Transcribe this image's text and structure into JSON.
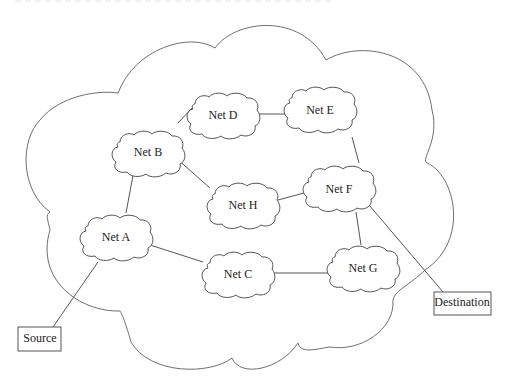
{
  "diagram": {
    "type": "network-topology",
    "internet_cloud_label": "",
    "nodes": [
      {
        "id": "A",
        "label": "Net A",
        "cx": 115,
        "cy": 238
      },
      {
        "id": "B",
        "label": "Net B",
        "cx": 145,
        "cy": 128
      },
      {
        "id": "C",
        "label": "Net C",
        "cx": 237,
        "cy": 275
      },
      {
        "id": "D",
        "label": "Net D",
        "cx": 222,
        "cy": 90
      },
      {
        "id": "E",
        "label": "Net E",
        "cx": 320,
        "cy": 83
      },
      {
        "id": "F",
        "label": "Net F",
        "cx": 340,
        "cy": 190
      },
      {
        "id": "G",
        "label": "Net G",
        "cx": 363,
        "cy": 268
      },
      {
        "id": "H",
        "label": "Net H",
        "cx": 243,
        "cy": 205
      }
    ],
    "endpoints": {
      "source": {
        "label": "Source"
      },
      "destination": {
        "label": "Destination"
      }
    },
    "links": [
      [
        "Source",
        "A"
      ],
      [
        "A",
        "B"
      ],
      [
        "A",
        "C"
      ],
      [
        "B",
        "D"
      ],
      [
        "B",
        "H"
      ],
      [
        "D",
        "E"
      ],
      [
        "E",
        "F"
      ],
      [
        "H",
        "F"
      ],
      [
        "F",
        "G"
      ],
      [
        "C",
        "G"
      ],
      [
        "F",
        "Destination"
      ]
    ]
  },
  "colors": {
    "stroke": "#555555",
    "outline": "#6e6e6e",
    "text": "#222222",
    "background": "#ffffff"
  }
}
